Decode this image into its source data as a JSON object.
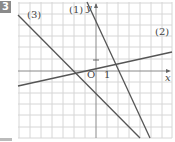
{
  "problem": {
    "number": "3"
  },
  "graph": {
    "origin_label": "O",
    "x_axis_label": "x",
    "y_axis_label": "y",
    "x_unit_label": "1",
    "y_unit_label": "1",
    "lines": [
      {
        "label": "(1)",
        "from": [
          87,
          2
        ],
        "to": [
          150,
          138
        ]
      },
      {
        "label": "(2)",
        "from": [
          18,
          86
        ],
        "to": [
          172,
          52
        ]
      },
      {
        "label": "(3)",
        "from": [
          18,
          15
        ],
        "to": [
          140,
          138
        ]
      }
    ],
    "grid": {
      "left": 18,
      "top": 2,
      "right": 172,
      "bottom": 138,
      "spacing": 11,
      "origin_px": [
        96,
        71
      ]
    },
    "colors": {
      "grid": "#d4d4d4",
      "axis": "#888888",
      "line": "#555555",
      "badge": "#8a8a8a"
    }
  }
}
